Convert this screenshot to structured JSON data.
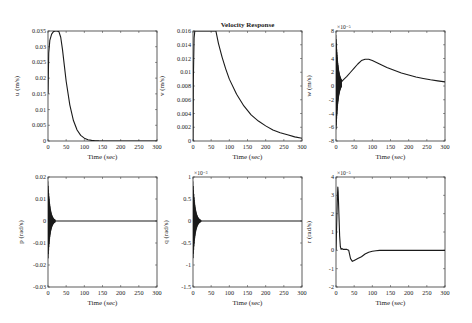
{
  "figure": {
    "title": "Velocity Response",
    "background": "#ffffff",
    "line_color": "#1a1a1a",
    "axis_color": "#333333"
  },
  "chart_data": [
    {
      "type": "line",
      "id": "u",
      "ylabel": "u (m/s)",
      "xlabel": "Time (sec)",
      "title": "",
      "xlim": [
        0,
        300
      ],
      "ylim": [
        0,
        0.035
      ],
      "xticks": [
        0,
        50,
        100,
        150,
        200,
        250,
        300
      ],
      "yticks": [
        0,
        0.005,
        0.01,
        0.015,
        0.02,
        0.025,
        0.03,
        0.035
      ],
      "ytick_labels": [
        "0",
        "0.005",
        "0.01",
        "0.015",
        "0.02",
        "0.025",
        "0.03",
        "0.035"
      ],
      "exponent": "",
      "grid": false,
      "x": [
        0,
        2,
        5,
        10,
        15,
        20,
        25,
        30,
        35,
        40,
        45,
        50,
        60,
        70,
        80,
        90,
        100,
        110,
        120,
        130,
        140,
        150,
        200,
        250,
        300
      ],
      "y": [
        0.015,
        0.028,
        0.032,
        0.034,
        0.0348,
        0.035,
        0.035,
        0.0348,
        0.033,
        0.029,
        0.024,
        0.019,
        0.0115,
        0.0065,
        0.0035,
        0.0018,
        0.0009,
        0.0004,
        0.0002,
        0.0001,
        3e-05,
        0.0,
        0.0,
        0.0,
        0.0
      ]
    },
    {
      "type": "line",
      "id": "v",
      "ylabel": "v (m/s)",
      "xlabel": "Time (sec)",
      "title": "Velocity Response",
      "xlim": [
        0,
        300
      ],
      "ylim": [
        0,
        0.016
      ],
      "xticks": [
        0,
        50,
        100,
        150,
        200,
        250,
        300
      ],
      "yticks": [
        0,
        0.002,
        0.004,
        0.006,
        0.008,
        0.01,
        0.012,
        0.014,
        0.016
      ],
      "ytick_labels": [
        "0",
        "0.002",
        "0.004",
        "0.006",
        "0.008",
        "0.01",
        "0.012",
        "0.014",
        "0.016"
      ],
      "exponent": "",
      "grid": false,
      "x": [
        0,
        1,
        3,
        5,
        10,
        20,
        40,
        60,
        63,
        70,
        80,
        90,
        100,
        120,
        140,
        160,
        180,
        200,
        220,
        240,
        260,
        280,
        300
      ],
      "y": [
        0.0,
        0.009,
        0.015,
        0.016,
        0.016,
        0.016,
        0.016,
        0.016,
        0.016,
        0.0142,
        0.0122,
        0.0105,
        0.009,
        0.0068,
        0.0051,
        0.0038,
        0.0029,
        0.0022,
        0.0016,
        0.0012,
        0.0009,
        0.0006,
        0.0004
      ]
    },
    {
      "type": "line",
      "id": "w",
      "ylabel": "w (m/s)",
      "xlabel": "Time (sec)",
      "title": "",
      "xlim": [
        0,
        300
      ],
      "ylim": [
        -8,
        8
      ],
      "xticks": [
        0,
        50,
        100,
        150,
        200,
        250,
        300
      ],
      "yticks": [
        -8,
        -6,
        -4,
        -2,
        0,
        2,
        4,
        6,
        8
      ],
      "ytick_labels": [
        "-8",
        "-6",
        "-4",
        "-2",
        "0",
        "2",
        "4",
        "6",
        "8"
      ],
      "exponent": "×10⁻⁵",
      "grid": false,
      "oscillation": {
        "x_start": 0,
        "x_end": 15,
        "amplitude_start": 7.0,
        "amplitude_end": 0.5,
        "center": 0.4
      },
      "x": [
        15,
        20,
        30,
        40,
        50,
        60,
        70,
        80,
        90,
        100,
        120,
        140,
        160,
        180,
        200,
        220,
        240,
        260,
        280,
        300
      ],
      "y": [
        0.6,
        0.9,
        1.4,
        2.0,
        2.6,
        3.2,
        3.7,
        3.9,
        3.9,
        3.7,
        3.2,
        2.7,
        2.3,
        1.9,
        1.6,
        1.3,
        1.1,
        0.9,
        0.75,
        0.6
      ]
    },
    {
      "type": "line",
      "id": "p",
      "ylabel": "p (rad/s)",
      "xlabel": "Time (sec)",
      "title": "",
      "xlim": [
        0,
        300
      ],
      "ylim": [
        -0.03,
        0.02
      ],
      "xticks": [
        0,
        50,
        100,
        150,
        200,
        250,
        300
      ],
      "yticks": [
        -0.03,
        -0.02,
        -0.01,
        0,
        0.01,
        0.02
      ],
      "ytick_labels": [
        "-0.03",
        "-0.02",
        "-0.01",
        "0",
        "0.01",
        "0.02"
      ],
      "exponent": "",
      "grid": false,
      "oscillation": {
        "x_start": 0,
        "x_end": 20,
        "amplitude_start": 0.018,
        "amplitude_end": 0.0005,
        "center": 0
      },
      "x": [
        20,
        40,
        60,
        100,
        150,
        200,
        250,
        300
      ],
      "y": [
        0,
        0,
        0,
        0,
        0,
        0,
        0,
        0
      ]
    },
    {
      "type": "line",
      "id": "q",
      "ylabel": "q (rad/s)",
      "xlabel": "Time (sec)",
      "title": "",
      "xlim": [
        0,
        300
      ],
      "ylim": [
        -1.5,
        1
      ],
      "xticks": [
        0,
        50,
        100,
        150,
        200,
        250,
        300
      ],
      "yticks": [
        -1.5,
        -1,
        -0.5,
        0,
        0.5,
        1
      ],
      "ytick_labels": [
        "-1.5",
        "-1",
        "-0.5",
        "0",
        "0.5",
        "1"
      ],
      "exponent": "×10⁻³",
      "grid": false,
      "oscillation": {
        "x_start": 0,
        "x_end": 22,
        "amplitude_start": 0.9,
        "amplitude_end": 0.02,
        "center": 0
      },
      "x": [
        22,
        40,
        60,
        100,
        150,
        200,
        250,
        300
      ],
      "y": [
        0,
        0,
        0,
        0,
        0,
        0,
        0,
        0
      ]
    },
    {
      "type": "line",
      "id": "r",
      "ylabel": "r (rad/s)",
      "xlabel": "Time (sec)",
      "title": "",
      "xlim": [
        0,
        300
      ],
      "ylim": [
        -2,
        4
      ],
      "xticks": [
        0,
        50,
        100,
        150,
        200,
        250,
        300
      ],
      "yticks": [
        -2,
        -1,
        0,
        1,
        2,
        3,
        4
      ],
      "ytick_labels": [
        "-2",
        "-1",
        "0",
        "1",
        "2",
        "3",
        "4"
      ],
      "exponent": "×10⁻⁵",
      "grid": false,
      "x": [
        0,
        2,
        4,
        5,
        6,
        8,
        10,
        12,
        14,
        16,
        20,
        30,
        35,
        40,
        45,
        50,
        60,
        70,
        80,
        90,
        100,
        110,
        120,
        130,
        150,
        200,
        250,
        300
      ],
      "y": [
        0,
        1.5,
        3.0,
        3.45,
        3.2,
        2.0,
        0.8,
        0.2,
        0.05,
        0.1,
        0.05,
        0.05,
        0.0,
        -0.45,
        -0.6,
        -0.55,
        -0.45,
        -0.35,
        -0.2,
        -0.1,
        -0.05,
        -0.02,
        0.0,
        0.0,
        0.0,
        0.0,
        0.0,
        0.0
      ]
    }
  ],
  "layout": {
    "panels": [
      {
        "id": "u",
        "x": 48,
        "y": 31,
        "w": 109,
        "h": 110
      },
      {
        "id": "v",
        "x": 193,
        "y": 31,
        "w": 109,
        "h": 110
      },
      {
        "id": "w",
        "x": 336,
        "y": 31,
        "w": 109,
        "h": 110
      },
      {
        "id": "p",
        "x": 48,
        "y": 177,
        "w": 109,
        "h": 110
      },
      {
        "id": "q",
        "x": 193,
        "y": 177,
        "w": 109,
        "h": 110
      },
      {
        "id": "r",
        "x": 336,
        "y": 177,
        "w": 109,
        "h": 110
      }
    ]
  }
}
